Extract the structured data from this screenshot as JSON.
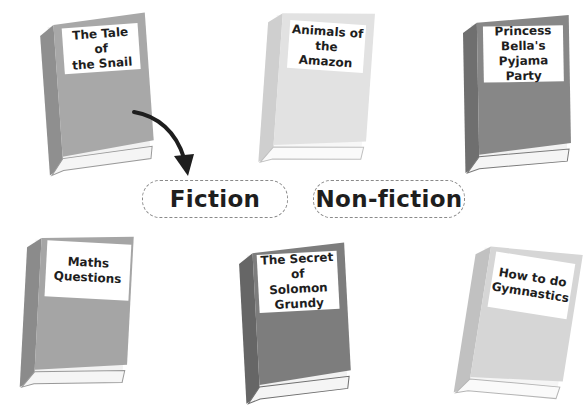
{
  "books": [
    {
      "id": "tale-of-the-snail",
      "title": "The Tale of the Snail",
      "lines": [
        "The Tale of",
        "the Snail"
      ],
      "cover_color": "#a8a8a8",
      "spine_color": "#8f8f8f",
      "x": 38,
      "y": 14,
      "rotate": -4,
      "sorted_into": "Fiction"
    },
    {
      "id": "animals-of-the-amazon",
      "title": "Animals of the Amazon",
      "lines": [
        "Animals of",
        "the Amazon"
      ],
      "cover_color": "#e2e2e2",
      "spine_color": "#cfcfcf",
      "x": 258,
      "y": 8,
      "rotate": 4
    },
    {
      "id": "princess-bellas-pyjama-party",
      "title": "Princess Bella's Pyjama Party",
      "lines": [
        "Princess",
        "Bella's",
        "Pyjama Party"
      ],
      "cover_color": "#878787",
      "spine_color": "#6f6f6f",
      "x": 460,
      "y": 14,
      "rotate": -1
    },
    {
      "id": "maths-questions",
      "title": "Maths Questions",
      "lines": [
        "Maths",
        "Questions"
      ],
      "cover_color": "#a5a5a5",
      "spine_color": "#8b8b8b",
      "x": 22,
      "y": 230,
      "rotate": 3
    },
    {
      "id": "secret-of-solomon-grundy",
      "title": "The Secret of Solomon Grundy",
      "lines": [
        "The Secret",
        "of Solomon",
        "Grundy"
      ],
      "cover_color": "#7d7d7d",
      "spine_color": "#666666",
      "x": 236,
      "y": 241,
      "rotate": -3
    },
    {
      "id": "how-to-do-gymnastics",
      "title": "How to do Gymnastics",
      "lines": [
        "How to do",
        "Gymnastics"
      ],
      "cover_color": "#d6d6d6",
      "spine_color": "#c1c1c1",
      "x": 462,
      "y": 243,
      "rotate": 9
    }
  ],
  "categories": [
    {
      "id": "fiction",
      "label": "Fiction"
    },
    {
      "id": "non-fiction",
      "label": "Non-fiction"
    }
  ],
  "arrow": {
    "from": "tale-of-the-snail",
    "to": "fiction"
  }
}
